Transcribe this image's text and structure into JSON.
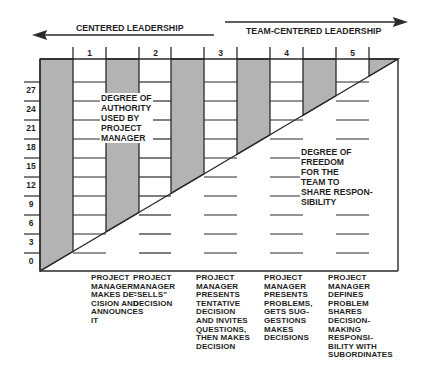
{
  "header": {
    "left_arrow_label": "CENTERED LEADERSHIP",
    "right_arrow_label": "TEAM-CENTERED LEADERSHIP"
  },
  "columns": [
    "1",
    "2",
    "3",
    "4",
    "5"
  ],
  "y_axis": {
    "ticks": [
      "27",
      "24",
      "21",
      "18",
      "15",
      "12",
      "9",
      "6",
      "3",
      "0"
    ]
  },
  "regions": {
    "authority": "DEGREE OF\nAUTHORITY\nUSED BY\nPROJECT\nMANAGER",
    "freedom": "DEGREE OF\nFREEDOM\nFOR THE\nTEAM TO\nSHARE RESPON-\nSIBILITY"
  },
  "descriptions": [
    "PROJECT\nMANAGER\nMAKES DE-\nCISION AND\nANNOUNCES\nIT",
    "PROJECT\nMANAGER\n\"SELLS\"\nDECISION",
    "PROJECT\nMANAGER\nPRESENTS\nTENTATIVE\nDECISION\nAND INVITES\nQUESTIONS,\nTHEN MAKES\nDECISION",
    "PROJECT\nMANAGER\nPRESENTS\nPROBLEMS,\nGETS SUG-\nGESTIONS\nMAKES\nDECISIONS",
    "PROJECT\nMANAGER\nDEFINES\nPROBLEM\nSHARES\nDECISION-\nMAKING\nRESPONSI-\nBILITY WITH\nSUBORDINATES"
  ],
  "colors": {
    "shade": "#b3b3b3",
    "line": "#2a2a2a"
  }
}
